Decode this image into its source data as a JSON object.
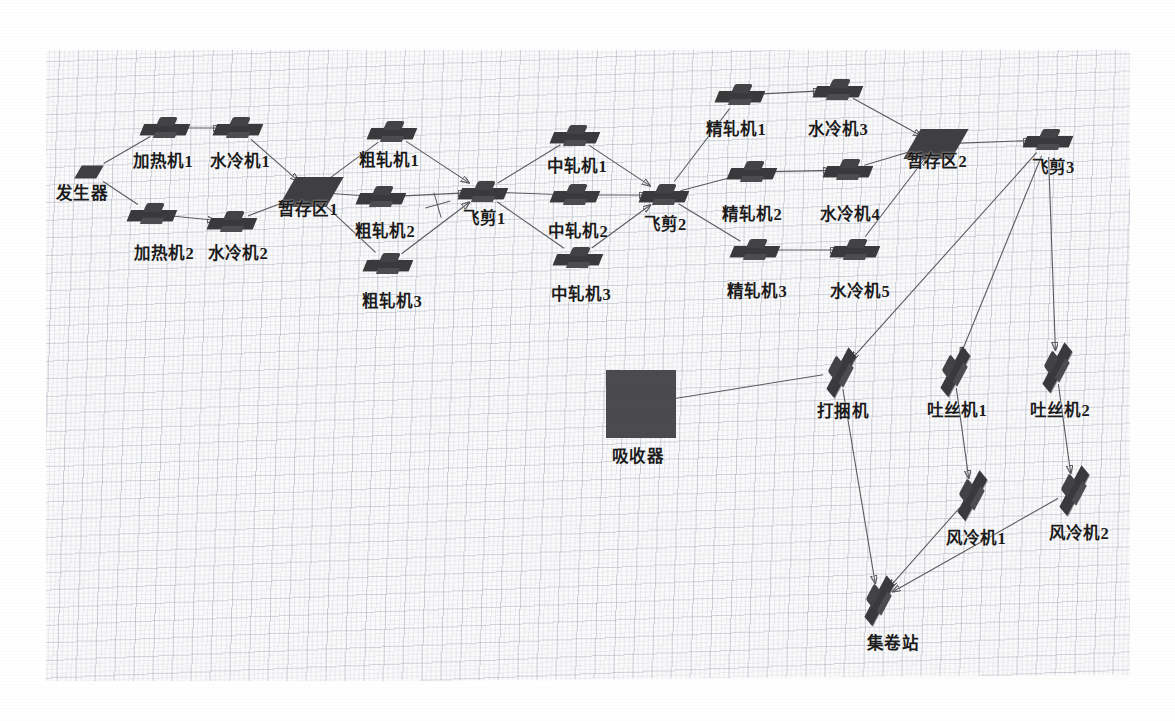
{
  "scene": {
    "title": "轧钢生产线布局图",
    "background": "#fdfdfd",
    "grid_color": "#78809666",
    "machine_color": "#3a3a3c",
    "buffer_color": "#3f3f42",
    "absorber_color": "#4b4b4d",
    "link_color": "#5a5a5f"
  },
  "nodes": {
    "generator": {
      "label": "发生器",
      "x": 89,
      "y": 172,
      "lx": 82,
      "ly": 180,
      "type": "buffer-small"
    },
    "heater1": {
      "label": "加热机1",
      "x": 165,
      "y": 128,
      "lx": 163,
      "ly": 148,
      "type": "machine"
    },
    "cooler1": {
      "label": "水冷机1",
      "x": 238,
      "y": 128,
      "lx": 240,
      "ly": 148,
      "type": "machine"
    },
    "heater2": {
      "label": "加热机2",
      "x": 152,
      "y": 214,
      "lx": 164,
      "ly": 240,
      "type": "machine"
    },
    "cooler2": {
      "label": "水冷机2",
      "x": 232,
      "y": 222,
      "lx": 238,
      "ly": 240,
      "type": "machine"
    },
    "buffer1": {
      "label": "暂存区1",
      "x": 311,
      "y": 192,
      "lx": 308,
      "ly": 196,
      "type": "buffer"
    },
    "rough1": {
      "label": "粗轧机1",
      "x": 392,
      "y": 132,
      "lx": 389,
      "ly": 147,
      "type": "machine"
    },
    "rough2": {
      "label": "粗轧机2",
      "x": 381,
      "y": 197,
      "lx": 385,
      "ly": 218,
      "type": "machine"
    },
    "rough3": {
      "label": "粗轧机3",
      "x": 388,
      "y": 264,
      "lx": 392,
      "ly": 288,
      "type": "machine"
    },
    "shear1": {
      "label": "飞剪1",
      "x": 483,
      "y": 192,
      "lx": 484,
      "ly": 205,
      "type": "machine"
    },
    "mid1": {
      "label": "中轧机1",
      "x": 575,
      "y": 136,
      "lx": 577,
      "ly": 153,
      "type": "machine"
    },
    "mid2": {
      "label": "中轧机2",
      "x": 575,
      "y": 195,
      "lx": 578,
      "ly": 218,
      "type": "machine"
    },
    "mid3": {
      "label": "中轧机3",
      "x": 578,
      "y": 258,
      "lx": 581,
      "ly": 281,
      "type": "machine"
    },
    "shear2": {
      "label": "飞剪2",
      "x": 664,
      "y": 195,
      "lx": 665,
      "ly": 211,
      "type": "machine"
    },
    "finish1": {
      "label": "精轧机1",
      "x": 740,
      "y": 95,
      "lx": 736,
      "ly": 116,
      "type": "machine"
    },
    "finish2": {
      "label": "精轧机2",
      "x": 752,
      "y": 172,
      "lx": 752,
      "ly": 201,
      "type": "machine"
    },
    "finish3": {
      "label": "精轧机3",
      "x": 755,
      "y": 250,
      "lx": 757,
      "ly": 278,
      "type": "machine"
    },
    "cooler3": {
      "label": "水冷机3",
      "x": 838,
      "y": 90,
      "lx": 838,
      "ly": 116,
      "type": "machine"
    },
    "cooler4": {
      "label": "水冷机4",
      "x": 848,
      "y": 170,
      "lx": 850,
      "ly": 201,
      "type": "machine"
    },
    "cooler5": {
      "label": "水冷机5",
      "x": 855,
      "y": 250,
      "lx": 860,
      "ly": 278,
      "type": "machine"
    },
    "buffer2": {
      "label": "暂存区2",
      "x": 936,
      "y": 144,
      "lx": 937,
      "ly": 148,
      "type": "buffer"
    },
    "shear3": {
      "label": "飞剪3",
      "x": 1048,
      "y": 140,
      "lx": 1053,
      "ly": 154,
      "type": "machine"
    },
    "absorber": {
      "label": "吸收器",
      "x": 641,
      "y": 404,
      "lx": 638,
      "ly": 443,
      "type": "absorber"
    },
    "bundler": {
      "label": "打捆机",
      "x": 840,
      "y": 372,
      "lx": 843,
      "ly": 398,
      "type": "machine-rot"
    },
    "laying1": {
      "label": "吐丝机1",
      "x": 954,
      "y": 371,
      "lx": 957,
      "ly": 397,
      "type": "machine-rot"
    },
    "laying2": {
      "label": "吐丝机2",
      "x": 1056,
      "y": 367,
      "lx": 1060,
      "ly": 397,
      "type": "machine-rot"
    },
    "aircool1": {
      "label": "风冷机1",
      "x": 971,
      "y": 495,
      "lx": 976,
      "ly": 525,
      "type": "machine-rot"
    },
    "aircool2": {
      "label": "风冷机2",
      "x": 1073,
      "y": 490,
      "lx": 1079,
      "ly": 520,
      "type": "machine-rot"
    },
    "coilstation": {
      "label": "集卷站",
      "x": 878,
      "y": 600,
      "lx": 893,
      "ly": 630,
      "type": "machine-rot"
    }
  },
  "edges": [
    {
      "from": "generator",
      "to": "heater1",
      "arrow": false
    },
    {
      "from": "generator",
      "to": "heater2",
      "arrow": false
    },
    {
      "from": "heater1",
      "to": "cooler1",
      "arrow": true
    },
    {
      "from": "heater2",
      "to": "cooler2",
      "arrow": true
    },
    {
      "from": "cooler1",
      "to": "buffer1",
      "arrow": true
    },
    {
      "from": "cooler2",
      "to": "buffer1",
      "arrow": true
    },
    {
      "from": "buffer1",
      "to": "rough1",
      "arrow": false
    },
    {
      "from": "buffer1",
      "to": "rough2",
      "arrow": false
    },
    {
      "from": "buffer1",
      "to": "rough3",
      "arrow": false
    },
    {
      "from": "rough1",
      "to": "shear1",
      "arrow": true
    },
    {
      "from": "rough2",
      "to": "shear1",
      "arrow": true
    },
    {
      "from": "rough3",
      "to": "shear1",
      "arrow": true
    },
    {
      "from": "shear1",
      "to": "mid1",
      "arrow": false
    },
    {
      "from": "shear1",
      "to": "mid2",
      "arrow": false
    },
    {
      "from": "shear1",
      "to": "mid3",
      "arrow": false
    },
    {
      "from": "mid1",
      "to": "shear2",
      "arrow": true
    },
    {
      "from": "mid2",
      "to": "shear2",
      "arrow": true
    },
    {
      "from": "mid3",
      "to": "shear2",
      "arrow": true
    },
    {
      "from": "shear2",
      "to": "finish1",
      "arrow": false
    },
    {
      "from": "shear2",
      "to": "finish2",
      "arrow": false
    },
    {
      "from": "shear2",
      "to": "finish3",
      "arrow": false
    },
    {
      "from": "finish1",
      "to": "cooler3",
      "arrow": true
    },
    {
      "from": "finish2",
      "to": "cooler4",
      "arrow": true
    },
    {
      "from": "finish3",
      "to": "cooler5",
      "arrow": true
    },
    {
      "from": "cooler3",
      "to": "buffer2",
      "arrow": true
    },
    {
      "from": "cooler4",
      "to": "buffer2",
      "arrow": true
    },
    {
      "from": "cooler5",
      "to": "buffer2",
      "arrow": true
    },
    {
      "from": "buffer2",
      "to": "shear3",
      "arrow": true
    },
    {
      "from": "shear3",
      "to": "bundler",
      "arrow": true
    },
    {
      "from": "shear3",
      "to": "laying1",
      "arrow": true
    },
    {
      "from": "shear3",
      "to": "laying2",
      "arrow": true
    },
    {
      "from": "absorber",
      "to": "bundler",
      "arrow": false
    },
    {
      "from": "laying1",
      "to": "aircool1",
      "arrow": true
    },
    {
      "from": "laying2",
      "to": "aircool2",
      "arrow": true
    },
    {
      "from": "bundler",
      "to": "coilstation",
      "arrow": true
    },
    {
      "from": "aircool1",
      "to": "coilstation",
      "arrow": true
    },
    {
      "from": "aircool2",
      "to": "coilstation",
      "arrow": true
    }
  ],
  "markers": [
    {
      "name": "crosshair-cursor",
      "x": 438,
      "y": 205
    }
  ]
}
